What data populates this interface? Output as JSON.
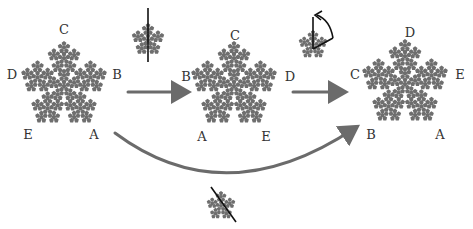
{
  "colors": {
    "fractal": "#6e6e6e",
    "arrow": "#6b6b6b",
    "line": "#111111",
    "label": "#333333"
  },
  "pentaflakes": [
    {
      "id": "original",
      "cx": 64,
      "cy": 86,
      "r": 45,
      "rot": 0,
      "labels": [
        {
          "t": "C",
          "x": 64,
          "y": 29
        },
        {
          "t": "B",
          "x": 117,
          "y": 74
        },
        {
          "t": "D",
          "x": 12,
          "y": 74
        },
        {
          "t": "E",
          "x": 28,
          "y": 134
        },
        {
          "t": "A",
          "x": 94,
          "y": 134
        }
      ]
    },
    {
      "id": "reflected",
      "cx": 234,
      "cy": 86,
      "r": 45,
      "rot": 0,
      "labels": [
        {
          "t": "C",
          "x": 235,
          "y": 35
        },
        {
          "t": "B",
          "x": 186,
          "y": 76
        },
        {
          "t": "D",
          "x": 290,
          "y": 76
        },
        {
          "t": "A",
          "x": 202,
          "y": 136
        },
        {
          "t": "E",
          "x": 266,
          "y": 136
        }
      ]
    },
    {
      "id": "rotated",
      "cx": 405,
      "cy": 84,
      "r": 45,
      "rot": 0,
      "labels": [
        {
          "t": "D",
          "x": 410,
          "y": 32
        },
        {
          "t": "C",
          "x": 355,
          "y": 74
        },
        {
          "t": "E",
          "x": 460,
          "y": 74
        },
        {
          "t": "B",
          "x": 371,
          "y": 134
        },
        {
          "t": "A",
          "x": 440,
          "y": 134
        }
      ]
    }
  ],
  "operations": [
    {
      "id": "vertical-reflection",
      "cx": 148,
      "cy": 40,
      "r": 17,
      "line": [
        148,
        8,
        148,
        62
      ]
    },
    {
      "id": "rotation-72deg",
      "cx": 313,
      "cy": 45,
      "r": 15,
      "line": [
        313,
        49,
        313,
        17
      ]
    },
    {
      "id": "diagonal-reflection",
      "cx": 221,
      "cy": 206,
      "r": 15,
      "line": [
        211,
        187,
        236,
        222
      ]
    }
  ],
  "arrows": [
    {
      "id": "arrow-1",
      "from": [
        128,
        92
      ],
      "to": [
        186,
        92
      ]
    },
    {
      "id": "arrow-2",
      "from": [
        293,
        92
      ],
      "to": [
        343,
        92
      ]
    },
    {
      "id": "arrow-curved",
      "path": "M115,133 Q225,215 355,128"
    }
  ]
}
